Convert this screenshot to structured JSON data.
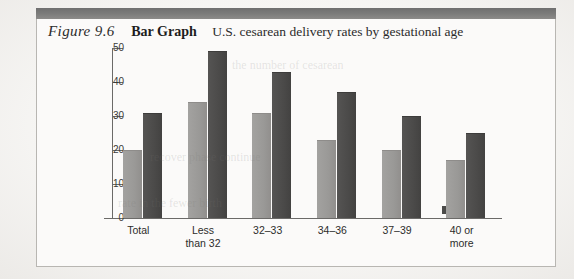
{
  "figure": {
    "number": "Figure 9.6",
    "kicker": "Bar Graph",
    "caption": "U.S. cesarean delivery rates by gestational age"
  },
  "chart_data": {
    "type": "bar",
    "title": "U.S. cesarean delivery rates by gestational age",
    "xlabel": "",
    "ylabel": "",
    "ylim": [
      0,
      50
    ],
    "yticks": [
      0,
      10,
      20,
      30,
      40,
      50
    ],
    "ytick_labels": [
      "0",
      "10",
      "20",
      "30",
      "40",
      "50"
    ],
    "grid": false,
    "legend": null,
    "categories": [
      "Total",
      "Less than 32",
      "32–33",
      "34–36",
      "37–39",
      "40 or more"
    ],
    "category_label_lines": [
      [
        "Total"
      ],
      [
        "Less",
        "than 32"
      ],
      [
        "32–33"
      ],
      [
        "34–36"
      ],
      [
        "37–39"
      ],
      [
        "40 or",
        "more"
      ]
    ],
    "series": [
      {
        "name": "light",
        "color": "#9a9997",
        "values": [
          20,
          34,
          31,
          23,
          20,
          17
        ]
      },
      {
        "name": "dark",
        "color": "#4b4a49",
        "values": [
          31,
          49,
          43,
          37,
          30,
          25
        ]
      }
    ]
  },
  "ghost_text": {
    "line1": "recover phase continue",
    "line2": "the number of cesarean",
    "line3": "rate in the fewer birth"
  }
}
